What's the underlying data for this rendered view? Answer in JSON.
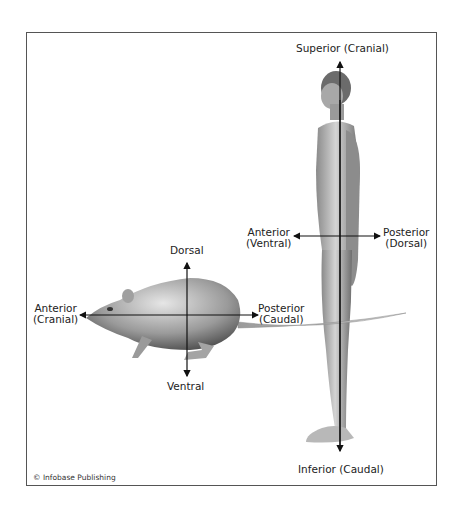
{
  "figure": {
    "credit": "© Infobase Publishing",
    "colors": {
      "frame": "#555555",
      "axis": "#111111",
      "figure_light": "#d9d9d9",
      "figure_dark": "#6a6a6a",
      "text": "#222222"
    }
  },
  "human": {
    "superior": "Superior (Cranial)",
    "inferior": "Inferior (Caudal)",
    "anterior_line1": "Anterior",
    "anterior_line2": "(Ventral)",
    "posterior_line1": "Posterior",
    "posterior_line2": "(Dorsal)"
  },
  "rat": {
    "dorsal": "Dorsal",
    "ventral": "Ventral",
    "anterior_line1": "Anterior",
    "anterior_line2": "(Cranial)",
    "posterior_line1": "Posterior",
    "posterior_line2": "(Caudal)"
  }
}
